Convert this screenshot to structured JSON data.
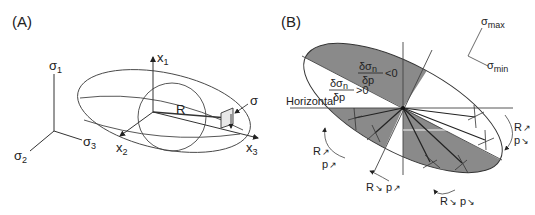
{
  "figure": {
    "panel_a": {
      "label": "(A)",
      "principal_axes": {
        "sigma1": {
          "base": "σ",
          "sub": "1"
        },
        "sigma2": {
          "base": "σ",
          "sub": "2"
        },
        "sigma3": {
          "base": "σ",
          "sub": "3"
        }
      },
      "ellipsoid_axes": {
        "x1": {
          "base": "x",
          "sub": "1"
        },
        "x2": {
          "base": "x",
          "sub": "2"
        },
        "x3": {
          "base": "x",
          "sub": "3"
        }
      },
      "radius_label": "R",
      "stress_label": "σ"
    },
    "panel_b": {
      "label": "(B)",
      "horizontal_label": "Horizontal",
      "region_negative": {
        "numerator": "δσ",
        "numerator_sub": "n",
        "denominator": "δp",
        "relation": "<0"
      },
      "region_positive": {
        "numerator": "δσ",
        "numerator_sub": "n",
        "denominator": "δp",
        "relation": ">0"
      },
      "stress_orientation": {
        "max": {
          "base": "σ",
          "sub": "max"
        },
        "min": {
          "base": "σ",
          "sub": "min"
        }
      },
      "rotation_labels": [
        {
          "id": "left",
          "r": "R",
          "r_arrow": "↗",
          "p": "p",
          "p_arrow": "↗"
        },
        {
          "id": "bottom-left",
          "r": "R",
          "r_arrow": "↘",
          "p": "p",
          "p_arrow": "↗"
        },
        {
          "id": "bottom-right",
          "r": "R",
          "r_arrow": "↘",
          "p": "p",
          "p_arrow": "↘"
        },
        {
          "id": "right",
          "r": "R",
          "r_arrow": "↗",
          "p": "p",
          "p_arrow": "↘"
        }
      ],
      "colors": {
        "shade": "#8a8a8a",
        "line": "#2a2a2a"
      }
    }
  }
}
